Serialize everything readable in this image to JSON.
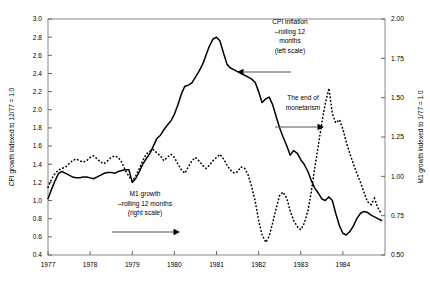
{
  "chart_data": {
    "type": "line",
    "title": "",
    "xlabel": "",
    "ylabel": "CPI growth indexed to 12/77 = 1.0",
    "y2label": "M1 growth indexed to 1/77 = 1.0",
    "xlim": [
      1977,
      1985
    ],
    "ylim": [
      0.4,
      3.0
    ],
    "y2lim": [
      0.5,
      2.0
    ],
    "grid": false,
    "legend": "annotations",
    "x_ticks": [
      "1977",
      "1978",
      "1979",
      "1980",
      "1981",
      "1982",
      "1983",
      "1984"
    ],
    "x_tick_values": [
      1977,
      1978,
      1979,
      1980,
      1981,
      1982,
      1983,
      1984
    ],
    "y_ticks": [
      "0.4",
      "0.6",
      "0.8",
      "1.0",
      "1.2",
      "1.4",
      "1.6",
      "1.8",
      "2.0",
      "2.2",
      "2.4",
      "2.6",
      "2.8",
      "3.0"
    ],
    "y_tick_values": [
      0.4,
      0.6,
      0.8,
      1.0,
      1.2,
      1.4,
      1.6,
      1.8,
      2.0,
      2.2,
      2.4,
      2.6,
      2.8,
      3.0
    ],
    "y2_ticks": [
      "0.50",
      "0.75",
      "1.00",
      "1.25",
      "1.50",
      "1.75",
      "2.00"
    ],
    "y2_tick_values": [
      0.5,
      0.75,
      1.0,
      1.25,
      1.5,
      1.75,
      2.0
    ],
    "series": [
      {
        "name": "CPI inflation — rolling 12 months",
        "axis": "left",
        "style": "solid",
        "x": [
          1977.0,
          1977.08,
          1977.17,
          1977.25,
          1977.33,
          1977.42,
          1977.5,
          1977.58,
          1977.67,
          1977.75,
          1977.83,
          1977.92,
          1978.0,
          1978.08,
          1978.17,
          1978.25,
          1978.33,
          1978.42,
          1978.5,
          1978.58,
          1978.67,
          1978.75,
          1978.83,
          1978.92,
          1979.0,
          1979.08,
          1979.17,
          1979.25,
          1979.33,
          1979.42,
          1979.5,
          1979.58,
          1979.67,
          1979.75,
          1979.83,
          1979.92,
          1980.0,
          1980.08,
          1980.17,
          1980.25,
          1980.33,
          1980.42,
          1980.5,
          1980.58,
          1980.67,
          1980.75,
          1980.83,
          1980.92,
          1981.0,
          1981.08,
          1981.17,
          1981.25,
          1981.33,
          1981.42,
          1981.5,
          1981.58,
          1981.67,
          1981.75,
          1981.83,
          1981.92,
          1982.0,
          1982.08,
          1982.17,
          1982.25,
          1982.33,
          1982.42,
          1982.5,
          1982.58,
          1982.67,
          1982.75,
          1982.83,
          1982.92,
          1983.0,
          1983.08,
          1983.17,
          1983.25,
          1983.33,
          1983.42,
          1983.5,
          1983.58,
          1983.67,
          1983.75,
          1983.83,
          1983.92,
          1984.0,
          1984.08,
          1984.17,
          1984.25,
          1984.33,
          1984.42,
          1984.5,
          1984.58,
          1984.67,
          1984.75,
          1984.83,
          1984.92
        ],
        "values": [
          1.02,
          1.12,
          1.22,
          1.3,
          1.32,
          1.3,
          1.28,
          1.26,
          1.25,
          1.25,
          1.26,
          1.26,
          1.25,
          1.24,
          1.26,
          1.28,
          1.3,
          1.31,
          1.31,
          1.3,
          1.32,
          1.33,
          1.34,
          1.34,
          1.2,
          1.24,
          1.32,
          1.4,
          1.46,
          1.52,
          1.6,
          1.68,
          1.72,
          1.78,
          1.83,
          1.88,
          1.95,
          2.05,
          2.18,
          2.26,
          2.27,
          2.3,
          2.36,
          2.42,
          2.5,
          2.6,
          2.7,
          2.78,
          2.8,
          2.76,
          2.62,
          2.5,
          2.46,
          2.44,
          2.42,
          2.4,
          2.38,
          2.36,
          2.34,
          2.3,
          2.2,
          2.08,
          2.12,
          2.14,
          2.06,
          1.92,
          1.8,
          1.7,
          1.6,
          1.5,
          1.55,
          1.52,
          1.45,
          1.4,
          1.32,
          1.22,
          1.14,
          1.08,
          1.02,
          1.0,
          1.04,
          1.0,
          0.86,
          0.72,
          0.64,
          0.62,
          0.66,
          0.72,
          0.8,
          0.86,
          0.88,
          0.87,
          0.84,
          0.82,
          0.8,
          0.78
        ]
      },
      {
        "name": "M1 growth — rolling 12 months",
        "axis": "right",
        "style": "dotted",
        "x": [
          1977.0,
          1977.08,
          1977.17,
          1977.25,
          1977.33,
          1977.42,
          1977.5,
          1977.58,
          1977.67,
          1977.75,
          1977.83,
          1977.92,
          1978.0,
          1978.08,
          1978.17,
          1978.25,
          1978.33,
          1978.42,
          1978.5,
          1978.58,
          1978.67,
          1978.75,
          1978.83,
          1978.92,
          1979.0,
          1979.08,
          1979.17,
          1979.25,
          1979.33,
          1979.42,
          1979.5,
          1979.58,
          1979.67,
          1979.75,
          1979.83,
          1979.92,
          1980.0,
          1980.08,
          1980.17,
          1980.25,
          1980.33,
          1980.42,
          1980.5,
          1980.58,
          1980.67,
          1980.75,
          1980.83,
          1980.92,
          1981.0,
          1981.08,
          1981.17,
          1981.25,
          1981.33,
          1981.42,
          1981.5,
          1981.58,
          1981.67,
          1981.75,
          1981.83,
          1981.92,
          1982.0,
          1982.08,
          1982.17,
          1982.25,
          1982.33,
          1982.42,
          1982.5,
          1982.58,
          1982.67,
          1982.75,
          1982.83,
          1982.92,
          1983.0,
          1983.08,
          1983.17,
          1983.25,
          1983.33,
          1983.42,
          1983.5,
          1983.58,
          1983.67,
          1983.75,
          1983.83,
          1983.92,
          1984.0,
          1984.08,
          1984.17,
          1984.25,
          1984.33,
          1984.42,
          1984.5,
          1984.58,
          1984.67,
          1984.75,
          1984.83,
          1984.92
        ],
        "values": [
          0.93,
          0.98,
          1.02,
          1.04,
          1.05,
          1.06,
          1.08,
          1.1,
          1.11,
          1.1,
          1.09,
          1.1,
          1.12,
          1.13,
          1.11,
          1.09,
          1.08,
          1.1,
          1.12,
          1.13,
          1.12,
          1.09,
          1.04,
          1.0,
          0.97,
          1.0,
          1.05,
          1.1,
          1.14,
          1.16,
          1.17,
          1.15,
          1.13,
          1.1,
          1.12,
          1.14,
          1.12,
          1.08,
          1.04,
          1.02,
          1.06,
          1.1,
          1.12,
          1.1,
          1.07,
          1.05,
          1.07,
          1.1,
          1.12,
          1.14,
          1.11,
          1.07,
          1.04,
          1.02,
          1.03,
          1.06,
          1.05,
          1.01,
          0.94,
          0.84,
          0.72,
          0.63,
          0.58,
          0.62,
          0.7,
          0.8,
          0.88,
          0.9,
          0.86,
          0.78,
          0.72,
          0.68,
          0.66,
          0.7,
          0.78,
          0.9,
          1.05,
          1.2,
          1.34,
          1.46,
          1.56,
          1.4,
          1.34,
          1.36,
          1.3,
          1.22,
          1.14,
          1.08,
          1.02,
          0.96,
          0.9,
          0.84,
          0.82,
          0.86,
          0.8,
          0.76
        ]
      }
    ],
    "annotations": [
      {
        "id": "cpi-annotation",
        "lines": [
          "CPI inflation",
          "–rolling 12",
          "months",
          "(left scale)"
        ],
        "arrow": "left",
        "text_x": 290,
        "text_y": 24,
        "arrow_x1": 291,
        "arrow_x2": 237,
        "arrow_y": 72
      },
      {
        "id": "m1-annotation",
        "lines": [
          "M1 growth",
          "–rolling 12 months",
          "(right scale)"
        ],
        "arrow": "right",
        "text_x": 145,
        "text_y": 196,
        "arrow_x1": 112,
        "arrow_x2": 180,
        "arrow_y": 232
      },
      {
        "id": "monetarism-annotation",
        "lines": [
          "The end of",
          "monetarism"
        ],
        "arrow": "right",
        "text_x": 303,
        "text_y": 100,
        "arrow_x1": 275,
        "arrow_x2": 324,
        "arrow_y": 127
      }
    ]
  },
  "plot": {
    "left": 48,
    "right": 385,
    "top": 19,
    "bottom": 255
  }
}
